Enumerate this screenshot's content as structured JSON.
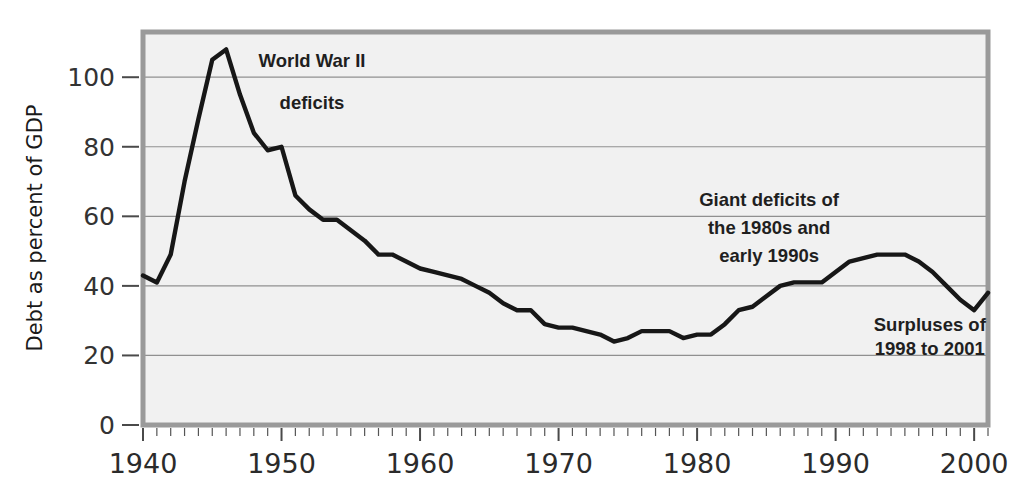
{
  "chart_data": {
    "type": "line",
    "title": "",
    "subtitle": "",
    "xlabel": "",
    "ylabel": "Debt as percent of GDP",
    "xlim": [
      1940,
      2001
    ],
    "ylim": [
      0,
      113
    ],
    "xticks": [
      1940,
      1950,
      1960,
      1970,
      1980,
      1990,
      2000
    ],
    "xtick_labels": [
      "1940",
      "1950",
      "1960",
      "1970",
      "1980",
      "1990",
      "2000"
    ],
    "yticks": [
      0,
      20,
      40,
      60,
      80,
      100
    ],
    "ytick_labels": [
      "0",
      "20",
      "40",
      "60",
      "80",
      "100"
    ],
    "grid": "horizontal",
    "legend": "none",
    "minor_xticks_interval": 1,
    "line_color": "#171717",
    "plot_background": "#f1f1f1",
    "gridline_color": "#909090",
    "series": [
      {
        "name": "Debt as percent of GDP",
        "x": [
          1940,
          1941,
          1942,
          1943,
          1944,
          1945,
          1946,
          1947,
          1948,
          1949,
          1950,
          1951,
          1952,
          1953,
          1954,
          1955,
          1956,
          1957,
          1958,
          1959,
          1960,
          1961,
          1962,
          1963,
          1964,
          1965,
          1966,
          1967,
          1968,
          1969,
          1970,
          1971,
          1972,
          1973,
          1974,
          1975,
          1976,
          1977,
          1978,
          1979,
          1980,
          1981,
          1982,
          1983,
          1984,
          1985,
          1986,
          1987,
          1988,
          1989,
          1990,
          1991,
          1992,
          1993,
          1994,
          1995,
          1996,
          1997,
          1998,
          1999,
          2000,
          2001
        ],
        "values": [
          43,
          41,
          49,
          70,
          88,
          105,
          108,
          95,
          84,
          79,
          80,
          66,
          62,
          59,
          59,
          56,
          53,
          49,
          49,
          47,
          45,
          44,
          43,
          42,
          40,
          38,
          35,
          33,
          33,
          29,
          28,
          28,
          27,
          26,
          24,
          25,
          27,
          27,
          27,
          25,
          26,
          26,
          29,
          33,
          34,
          37,
          40,
          41,
          41,
          41,
          44,
          47,
          48,
          49,
          49,
          49,
          47,
          44,
          40,
          36,
          33,
          38
        ]
      }
    ],
    "annotations": [
      {
        "id": "wwii",
        "lines": [
          "World War II",
          "deficits"
        ],
        "x_data": 1952.2,
        "y_data": [
          103,
          91
        ]
      },
      {
        "id": "giant-deficits",
        "lines": [
          "Giant deficits of",
          "the 1980s and",
          "early 1990s"
        ],
        "x_data": 1985.2,
        "y_data": [
          63,
          55,
          47
        ]
      },
      {
        "id": "surpluses",
        "lines": [
          "Surpluses of",
          "1998 to 2001"
        ],
        "x_data": 1996.8,
        "y_data": [
          27,
          20
        ]
      }
    ]
  }
}
